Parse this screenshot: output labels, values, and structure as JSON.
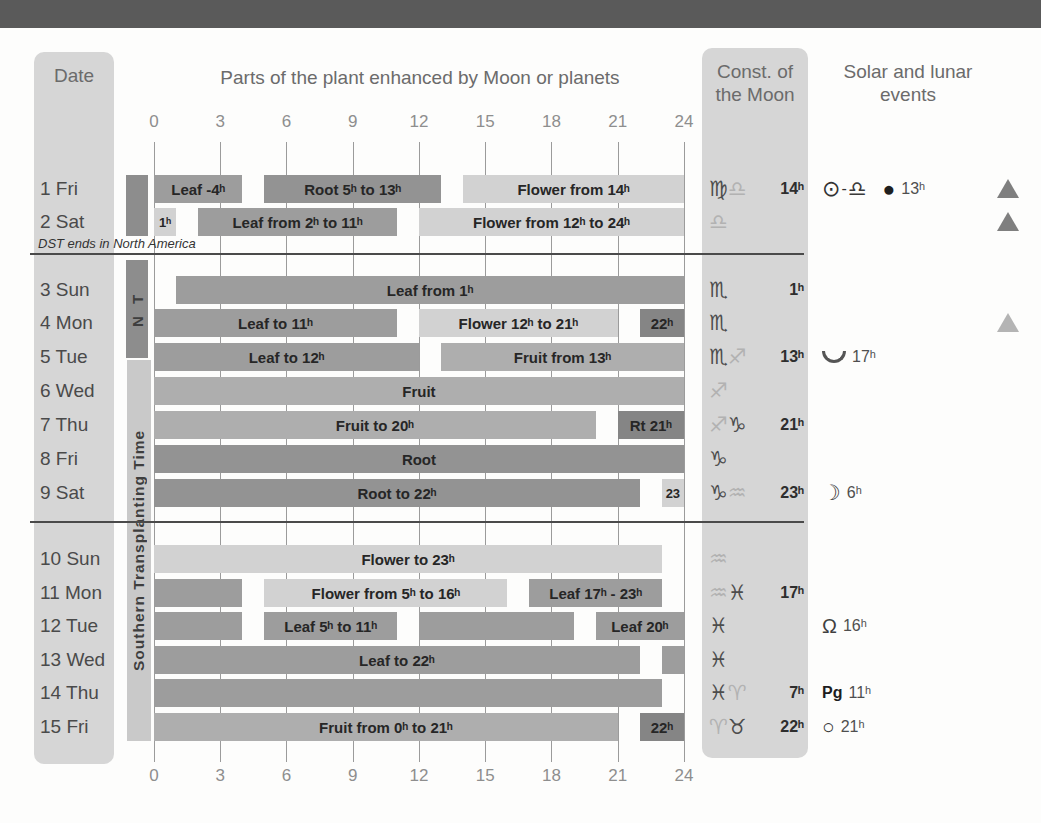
{
  "header": {
    "date_title": "Date",
    "chart_title": "Parts of the plant enhanced by Moon or planets",
    "const_title": "Const. of the Moon",
    "events_title": "Solar and lunar events"
  },
  "notes": {
    "dst": "DST ends in North America"
  },
  "transplanting": {
    "north_label": "N T",
    "south_label": "Southern Transplanting Time"
  },
  "colors": {
    "leaf": "#9d9d9d",
    "root": "#939393",
    "fruit": "#aeaeae",
    "flower": "#d2d2d2",
    "dark_box": "#858585",
    "strip": "#d6d6d6",
    "top_band": "#5a5a5a"
  },
  "chart_data": {
    "type": "gantt",
    "title": "Parts of the plant enhanced by Moon or planets",
    "x_axis": {
      "unit": "h",
      "min": 0,
      "max": 24,
      "ticks": [
        0,
        3,
        6,
        9,
        12,
        15,
        18,
        21,
        24
      ]
    },
    "categories": [
      "leaf",
      "root",
      "fruit",
      "flower"
    ],
    "rows": [
      {
        "date": "1 Fri",
        "bars": [
          {
            "from": 0,
            "to": 4,
            "label": "Leaf -4ʰ",
            "category": "leaf"
          },
          {
            "from": 5,
            "to": 13,
            "label": "Root 5ʰ to 13ʰ",
            "category": "root"
          },
          {
            "from": 14,
            "to": 24,
            "label": "Flower from 14ʰ",
            "category": "flower"
          }
        ],
        "moon_signs": [
          {
            "name": "virgo-icon",
            "char": "♍",
            "tone": "dark"
          },
          {
            "name": "libra-icon",
            "char": "♎",
            "tone": "light"
          }
        ],
        "moon_time": "14ʰ",
        "events": [
          {
            "name": "sun-icon",
            "char": "⊙",
            "cls": "ev-sun"
          },
          {
            "name": "dash",
            "char": "-",
            "cls": "ev-dash"
          },
          {
            "name": "libra-icon",
            "char": "♎",
            "cls": "ev-sym zodiac-font"
          },
          {
            "name": "new-moon-icon",
            "char": "●",
            "cls": "ev-moon"
          },
          {
            "name": "event-time",
            "char": "13ʰ",
            "cls": "ev-time"
          }
        ],
        "triangle": "dark"
      },
      {
        "date": "2 Sat",
        "bars": [
          {
            "from": 0,
            "to": 1,
            "label": "1ʰ",
            "category": "flower"
          },
          {
            "from": 2,
            "to": 11,
            "label": "Leaf from 2ʰ to 11ʰ",
            "category": "leaf"
          },
          {
            "from": 12,
            "to": 24,
            "label": "Flower from 12ʰ to 24ʰ",
            "category": "flower"
          }
        ],
        "moon_signs": [
          {
            "name": "libra-icon",
            "char": "♎",
            "tone": "light"
          }
        ],
        "moon_time": "",
        "events": [],
        "triangle": "dark"
      },
      {
        "date": "3 Sun",
        "bars": [
          {
            "from": 1,
            "to": 24,
            "label": "Leaf from 1ʰ",
            "category": "leaf"
          }
        ],
        "moon_signs": [
          {
            "name": "scorpio-icon",
            "char": "♏",
            "tone": "dark"
          }
        ],
        "moon_time": "1ʰ",
        "events": [],
        "triangle": null
      },
      {
        "date": "4 Mon",
        "bars": [
          {
            "from": 0,
            "to": 11,
            "label": "Leaf to 11ʰ",
            "category": "leaf"
          },
          {
            "from": 12,
            "to": 21,
            "label": "Flower 12ʰ to 21ʰ",
            "category": "flower"
          },
          {
            "from": 22,
            "to": 24,
            "label": "22ʰ",
            "category": "dark"
          }
        ],
        "moon_signs": [
          {
            "name": "scorpio-icon",
            "char": "♏",
            "tone": "dark"
          }
        ],
        "moon_time": "",
        "events": [],
        "triangle": "light"
      },
      {
        "date": "5 Tue",
        "bars": [
          {
            "from": 0,
            "to": 12,
            "label": "Leaf to 12ʰ",
            "category": "leaf"
          },
          {
            "from": 13,
            "to": 24,
            "label": "Fruit from 13ʰ",
            "category": "fruit"
          }
        ],
        "moon_signs": [
          {
            "name": "scorpio-icon",
            "char": "♏",
            "tone": "dark"
          },
          {
            "name": "sagittarius-icon",
            "char": "♐",
            "tone": "light"
          }
        ],
        "moon_time": "13ʰ",
        "events": [
          {
            "name": "moon-lowest-point-icon",
            "char": "",
            "cls": "ev-cup"
          },
          {
            "name": "event-time",
            "char": "17ʰ",
            "cls": "ev-time"
          }
        ],
        "triangle": null
      },
      {
        "date": "6 Wed",
        "bars": [
          {
            "from": 0,
            "to": 24,
            "label": "Fruit",
            "category": "fruit"
          }
        ],
        "moon_signs": [
          {
            "name": "sagittarius-icon",
            "char": "♐",
            "tone": "light"
          }
        ],
        "moon_time": "",
        "events": [],
        "triangle": null
      },
      {
        "date": "7 Thu",
        "bars": [
          {
            "from": 0,
            "to": 20,
            "label": "Fruit to 20ʰ",
            "category": "fruit"
          },
          {
            "from": 21,
            "to": 24,
            "label": "Rt 21ʰ",
            "category": "dark"
          }
        ],
        "moon_signs": [
          {
            "name": "sagittarius-icon",
            "char": "♐",
            "tone": "light"
          },
          {
            "name": "capricorn-icon",
            "char": "♑",
            "tone": "dark"
          }
        ],
        "moon_time": "21ʰ",
        "events": [],
        "triangle": null
      },
      {
        "date": "8 Fri",
        "bars": [
          {
            "from": 0,
            "to": 24,
            "label": "Root",
            "category": "root"
          }
        ],
        "moon_signs": [
          {
            "name": "capricorn-icon",
            "char": "♑",
            "tone": "dark"
          }
        ],
        "moon_time": "",
        "events": [],
        "triangle": null
      },
      {
        "date": "9 Sat",
        "bars": [
          {
            "from": 0,
            "to": 22,
            "label": "Root to 22ʰ",
            "category": "root"
          },
          {
            "from": 23,
            "to": 24,
            "label": "23",
            "category": "flower"
          }
        ],
        "moon_signs": [
          {
            "name": "capricorn-icon",
            "char": "♑",
            "tone": "dark"
          },
          {
            "name": "aquarius-icon",
            "char": "♒",
            "tone": "light"
          }
        ],
        "moon_time": "23ʰ",
        "events": [
          {
            "name": "first-quarter-moon-icon",
            "char": "☽",
            "cls": "ev-sym zodiac-font"
          },
          {
            "name": "event-time",
            "char": "6ʰ",
            "cls": "ev-time"
          }
        ],
        "triangle": null
      },
      {
        "date": "10 Sun",
        "bars": [
          {
            "from": 0,
            "to": 23,
            "label": "Flower to 23ʰ",
            "category": "flower"
          }
        ],
        "moon_signs": [
          {
            "name": "aquarius-icon",
            "char": "♒",
            "tone": "light"
          }
        ],
        "moon_time": "",
        "events": [],
        "triangle": null
      },
      {
        "date": "11 Mon",
        "bars": [
          {
            "from": 0,
            "to": 4,
            "label": "",
            "category": "leaf"
          },
          {
            "from": 5,
            "to": 16,
            "label": "Flower from 5ʰ to 16ʰ",
            "category": "flower"
          },
          {
            "from": 17,
            "to": 23,
            "label": "Leaf 17ʰ - 23ʰ",
            "category": "leaf"
          }
        ],
        "moon_signs": [
          {
            "name": "aquarius-icon",
            "char": "♒",
            "tone": "light"
          },
          {
            "name": "pisces-icon",
            "char": "♓",
            "tone": "dark"
          }
        ],
        "moon_time": "17ʰ",
        "events": [],
        "triangle": null
      },
      {
        "date": "12 Tue",
        "bars": [
          {
            "from": 0,
            "to": 4,
            "label": "",
            "category": "leaf"
          },
          {
            "from": 5,
            "to": 11,
            "label": "Leaf 5ʰ to 11ʰ",
            "category": "leaf"
          },
          {
            "from": 12,
            "to": 19,
            "label": "",
            "category": "leaf"
          },
          {
            "from": 20,
            "to": 24,
            "label": "Leaf 20ʰ",
            "category": "leaf"
          }
        ],
        "moon_signs": [
          {
            "name": "pisces-icon",
            "char": "♓",
            "tone": "dark"
          }
        ],
        "moon_time": "",
        "events": [
          {
            "name": "ascending-node-icon",
            "char": "Ω",
            "cls": "ev-node"
          },
          {
            "name": "event-time",
            "char": "16ʰ",
            "cls": "ev-time"
          }
        ],
        "triangle": null
      },
      {
        "date": "13 Wed",
        "bars": [
          {
            "from": 0,
            "to": 22,
            "label": "Leaf to 22ʰ",
            "category": "leaf"
          },
          {
            "from": 23,
            "to": 24,
            "label": "",
            "category": "leaf"
          }
        ],
        "moon_signs": [
          {
            "name": "pisces-icon",
            "char": "♓",
            "tone": "dark"
          }
        ],
        "moon_time": "",
        "events": [],
        "triangle": null
      },
      {
        "date": "14 Thu",
        "bars": [
          {
            "from": 0,
            "to": 23,
            "label": "",
            "category": "leaf"
          }
        ],
        "moon_signs": [
          {
            "name": "pisces-icon",
            "char": "♓",
            "tone": "dark"
          },
          {
            "name": "aries-icon",
            "char": "♈",
            "tone": "light"
          }
        ],
        "moon_time": "7ʰ",
        "events": [
          {
            "name": "perigee-label",
            "char": "Pg",
            "cls": "ev-pg"
          },
          {
            "name": "event-time",
            "char": "11ʰ",
            "cls": "ev-time"
          }
        ],
        "triangle": null
      },
      {
        "date": "15 Fri",
        "bars": [
          {
            "from": 0,
            "to": 21,
            "label": "Fruit from 0ʰ to 21ʰ",
            "category": "fruit"
          },
          {
            "from": 22,
            "to": 24,
            "label": "22ʰ",
            "category": "dark"
          }
        ],
        "moon_signs": [
          {
            "name": "aries-icon",
            "char": "♈",
            "tone": "light"
          },
          {
            "name": "taurus-icon",
            "char": "♉",
            "tone": "dark"
          }
        ],
        "moon_time": "22ʰ",
        "events": [
          {
            "name": "full-moon-icon",
            "char": "○",
            "cls": "ev-sym"
          },
          {
            "name": "event-time",
            "char": "21ʰ",
            "cls": "ev-time"
          }
        ],
        "triangle": null
      }
    ]
  }
}
